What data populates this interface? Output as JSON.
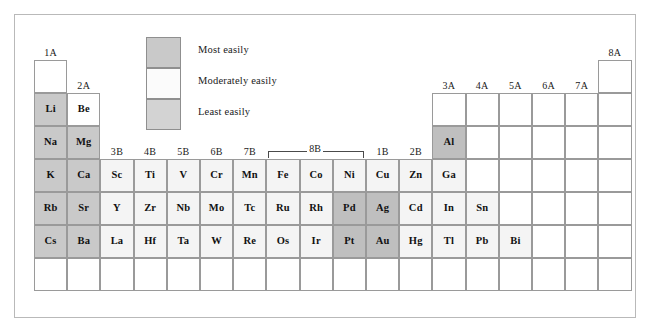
{
  "legend": {
    "items": [
      {
        "label": "Most easily",
        "shade": "#c9c9c9",
        "key": "most"
      },
      {
        "label": "Moderately easily",
        "shade": "#fbfbfb",
        "key": "moderate"
      },
      {
        "label": "Least easily",
        "shade": "#d3d3d3",
        "key": "least"
      }
    ]
  },
  "colors": {
    "most_easily": "#c9c9c9",
    "moderately_easily": "#f4f4f4",
    "least_easily": "#bfbfbf",
    "empty": "#ffffff",
    "border": "#9a9a9a",
    "frame": "#b9b9b9"
  },
  "group_labels": [
    {
      "text": "1A",
      "col": 1
    },
    {
      "text": "2A",
      "col": 2
    },
    {
      "text": "3B",
      "col": 3
    },
    {
      "text": "4B",
      "col": 4
    },
    {
      "text": "5B",
      "col": 5
    },
    {
      "text": "6B",
      "col": 6
    },
    {
      "text": "7B",
      "col": 7
    },
    {
      "text": "1B",
      "col": 11
    },
    {
      "text": "2B",
      "col": 12
    },
    {
      "text": "3A",
      "col": 13
    },
    {
      "text": "4A",
      "col": 14
    },
    {
      "text": "5A",
      "col": 15
    },
    {
      "text": "6A",
      "col": 16
    },
    {
      "text": "7A",
      "col": 17
    },
    {
      "text": "8A",
      "col": 18
    }
  ],
  "bracket": {
    "label": "8B",
    "start_col": 8,
    "end_col": 10
  },
  "table": {
    "cols": 18,
    "rows": 7,
    "cells": [
      {
        "sym": "",
        "col": 1,
        "row": 1,
        "shade": "empty"
      },
      {
        "sym": "",
        "col": 18,
        "row": 1,
        "shade": "empty"
      },
      {
        "sym": "Li",
        "col": 1,
        "row": 2,
        "shade": "most"
      },
      {
        "sym": "Be",
        "col": 2,
        "row": 2,
        "shade": "empty"
      },
      {
        "sym": "",
        "col": 13,
        "row": 2,
        "shade": "empty"
      },
      {
        "sym": "",
        "col": 14,
        "row": 2,
        "shade": "empty"
      },
      {
        "sym": "",
        "col": 15,
        "row": 2,
        "shade": "empty"
      },
      {
        "sym": "",
        "col": 16,
        "row": 2,
        "shade": "empty"
      },
      {
        "sym": "",
        "col": 17,
        "row": 2,
        "shade": "empty"
      },
      {
        "sym": "",
        "col": 18,
        "row": 2,
        "shade": "empty"
      },
      {
        "sym": "Na",
        "col": 1,
        "row": 3,
        "shade": "most"
      },
      {
        "sym": "Mg",
        "col": 2,
        "row": 3,
        "shade": "most"
      },
      {
        "sym": "Al",
        "col": 13,
        "row": 3,
        "shade": "least"
      },
      {
        "sym": "",
        "col": 14,
        "row": 3,
        "shade": "empty"
      },
      {
        "sym": "",
        "col": 15,
        "row": 3,
        "shade": "empty"
      },
      {
        "sym": "",
        "col": 16,
        "row": 3,
        "shade": "empty"
      },
      {
        "sym": "",
        "col": 17,
        "row": 3,
        "shade": "empty"
      },
      {
        "sym": "",
        "col": 18,
        "row": 3,
        "shade": "empty"
      },
      {
        "sym": "K",
        "col": 1,
        "row": 4,
        "shade": "most"
      },
      {
        "sym": "Ca",
        "col": 2,
        "row": 4,
        "shade": "most"
      },
      {
        "sym": "Sc",
        "col": 3,
        "row": 4,
        "shade": "moderate"
      },
      {
        "sym": "Ti",
        "col": 4,
        "row": 4,
        "shade": "moderate"
      },
      {
        "sym": "V",
        "col": 5,
        "row": 4,
        "shade": "moderate"
      },
      {
        "sym": "Cr",
        "col": 6,
        "row": 4,
        "shade": "moderate"
      },
      {
        "sym": "Mn",
        "col": 7,
        "row": 4,
        "shade": "moderate"
      },
      {
        "sym": "Fe",
        "col": 8,
        "row": 4,
        "shade": "moderate"
      },
      {
        "sym": "Co",
        "col": 9,
        "row": 4,
        "shade": "moderate"
      },
      {
        "sym": "Ni",
        "col": 10,
        "row": 4,
        "shade": "moderate"
      },
      {
        "sym": "Cu",
        "col": 11,
        "row": 4,
        "shade": "moderate"
      },
      {
        "sym": "Zn",
        "col": 12,
        "row": 4,
        "shade": "moderate"
      },
      {
        "sym": "Ga",
        "col": 13,
        "row": 4,
        "shade": "moderate"
      },
      {
        "sym": "",
        "col": 14,
        "row": 4,
        "shade": "empty"
      },
      {
        "sym": "",
        "col": 15,
        "row": 4,
        "shade": "empty"
      },
      {
        "sym": "",
        "col": 16,
        "row": 4,
        "shade": "empty"
      },
      {
        "sym": "",
        "col": 17,
        "row": 4,
        "shade": "empty"
      },
      {
        "sym": "",
        "col": 18,
        "row": 4,
        "shade": "empty"
      },
      {
        "sym": "Rb",
        "col": 1,
        "row": 5,
        "shade": "most"
      },
      {
        "sym": "Sr",
        "col": 2,
        "row": 5,
        "shade": "most"
      },
      {
        "sym": "Y",
        "col": 3,
        "row": 5,
        "shade": "moderate"
      },
      {
        "sym": "Zr",
        "col": 4,
        "row": 5,
        "shade": "moderate"
      },
      {
        "sym": "Nb",
        "col": 5,
        "row": 5,
        "shade": "moderate"
      },
      {
        "sym": "Mo",
        "col": 6,
        "row": 5,
        "shade": "moderate"
      },
      {
        "sym": "Tc",
        "col": 7,
        "row": 5,
        "shade": "moderate"
      },
      {
        "sym": "Ru",
        "col": 8,
        "row": 5,
        "shade": "moderate"
      },
      {
        "sym": "Rh",
        "col": 9,
        "row": 5,
        "shade": "moderate"
      },
      {
        "sym": "Pd",
        "col": 10,
        "row": 5,
        "shade": "least"
      },
      {
        "sym": "Ag",
        "col": 11,
        "row": 5,
        "shade": "least"
      },
      {
        "sym": "Cd",
        "col": 12,
        "row": 5,
        "shade": "moderate"
      },
      {
        "sym": "In",
        "col": 13,
        "row": 5,
        "shade": "moderate"
      },
      {
        "sym": "Sn",
        "col": 14,
        "row": 5,
        "shade": "moderate"
      },
      {
        "sym": "",
        "col": 15,
        "row": 5,
        "shade": "empty"
      },
      {
        "sym": "",
        "col": 16,
        "row": 5,
        "shade": "empty"
      },
      {
        "sym": "",
        "col": 17,
        "row": 5,
        "shade": "empty"
      },
      {
        "sym": "",
        "col": 18,
        "row": 5,
        "shade": "empty"
      },
      {
        "sym": "Cs",
        "col": 1,
        "row": 6,
        "shade": "most"
      },
      {
        "sym": "Ba",
        "col": 2,
        "row": 6,
        "shade": "most"
      },
      {
        "sym": "La",
        "col": 3,
        "row": 6,
        "shade": "moderate"
      },
      {
        "sym": "Hf",
        "col": 4,
        "row": 6,
        "shade": "moderate"
      },
      {
        "sym": "Ta",
        "col": 5,
        "row": 6,
        "shade": "moderate"
      },
      {
        "sym": "W",
        "col": 6,
        "row": 6,
        "shade": "moderate"
      },
      {
        "sym": "Re",
        "col": 7,
        "row": 6,
        "shade": "moderate"
      },
      {
        "sym": "Os",
        "col": 8,
        "row": 6,
        "shade": "moderate"
      },
      {
        "sym": "Ir",
        "col": 9,
        "row": 6,
        "shade": "moderate"
      },
      {
        "sym": "Pt",
        "col": 10,
        "row": 6,
        "shade": "least"
      },
      {
        "sym": "Au",
        "col": 11,
        "row": 6,
        "shade": "least"
      },
      {
        "sym": "Hg",
        "col": 12,
        "row": 6,
        "shade": "moderate"
      },
      {
        "sym": "Tl",
        "col": 13,
        "row": 6,
        "shade": "moderate"
      },
      {
        "sym": "Pb",
        "col": 14,
        "row": 6,
        "shade": "moderate"
      },
      {
        "sym": "Bi",
        "col": 15,
        "row": 6,
        "shade": "moderate"
      },
      {
        "sym": "",
        "col": 16,
        "row": 6,
        "shade": "empty"
      },
      {
        "sym": "",
        "col": 17,
        "row": 6,
        "shade": "empty"
      },
      {
        "sym": "",
        "col": 18,
        "row": 6,
        "shade": "empty"
      },
      {
        "sym": "",
        "col": 1,
        "row": 7,
        "shade": "empty"
      },
      {
        "sym": "",
        "col": 2,
        "row": 7,
        "shade": "empty"
      },
      {
        "sym": "",
        "col": 3,
        "row": 7,
        "shade": "empty"
      },
      {
        "sym": "",
        "col": 4,
        "row": 7,
        "shade": "empty"
      },
      {
        "sym": "",
        "col": 5,
        "row": 7,
        "shade": "empty"
      },
      {
        "sym": "",
        "col": 6,
        "row": 7,
        "shade": "empty"
      },
      {
        "sym": "",
        "col": 7,
        "row": 7,
        "shade": "empty"
      },
      {
        "sym": "",
        "col": 8,
        "row": 7,
        "shade": "empty"
      },
      {
        "sym": "",
        "col": 9,
        "row": 7,
        "shade": "empty"
      },
      {
        "sym": "",
        "col": 10,
        "row": 7,
        "shade": "empty"
      },
      {
        "sym": "",
        "col": 11,
        "row": 7,
        "shade": "empty"
      },
      {
        "sym": "",
        "col": 12,
        "row": 7,
        "shade": "empty"
      },
      {
        "sym": "",
        "col": 13,
        "row": 7,
        "shade": "empty"
      },
      {
        "sym": "",
        "col": 14,
        "row": 7,
        "shade": "empty"
      },
      {
        "sym": "",
        "col": 15,
        "row": 7,
        "shade": "empty"
      },
      {
        "sym": "",
        "col": 16,
        "row": 7,
        "shade": "empty"
      },
      {
        "sym": "",
        "col": 17,
        "row": 7,
        "shade": "empty"
      },
      {
        "sym": "",
        "col": 18,
        "row": 7,
        "shade": "empty"
      }
    ]
  }
}
